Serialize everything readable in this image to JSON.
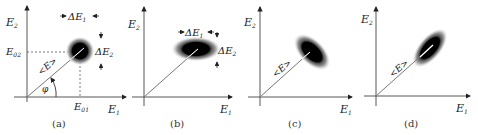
{
  "figure": {
    "panels": [
      {
        "id": "a",
        "caption": "(a)",
        "y_axis_label": "E",
        "y_axis_sub": "2",
        "x_axis_label": "E",
        "x_axis_sub": "1",
        "phasor_label": "<E>",
        "angle_label": "φ",
        "e02_label": "E",
        "e02_sub": "02",
        "e01_label": "E",
        "e01_sub": "01",
        "delta_e1_label": "ΔE",
        "delta_e1_sub": "1",
        "delta_e2_label": "ΔE",
        "delta_e2_sub": "2",
        "noise_shape": "circle"
      },
      {
        "id": "b",
        "caption": "(b)",
        "y_axis_label": "E",
        "y_axis_sub": "2",
        "x_axis_label": "E",
        "x_axis_sub": "1",
        "delta_e1_label": "ΔE",
        "delta_e1_sub": "1",
        "delta_e2_label": "ΔE",
        "delta_e2_sub": "2",
        "noise_shape": "horizontal-ellipse"
      },
      {
        "id": "c",
        "caption": "(c)",
        "y_axis_label": "E",
        "y_axis_sub": "2",
        "x_axis_label": "E",
        "x_axis_sub": "1",
        "phasor_label": "<E>",
        "noise_shape": "ellipse-perpendicular-to-phasor"
      },
      {
        "id": "d",
        "caption": "(d)",
        "y_axis_label": "E",
        "y_axis_sub": "2",
        "x_axis_label": "E",
        "x_axis_sub": "1",
        "phasor_label": "<E>",
        "noise_shape": "ellipse-along-phasor"
      }
    ]
  }
}
